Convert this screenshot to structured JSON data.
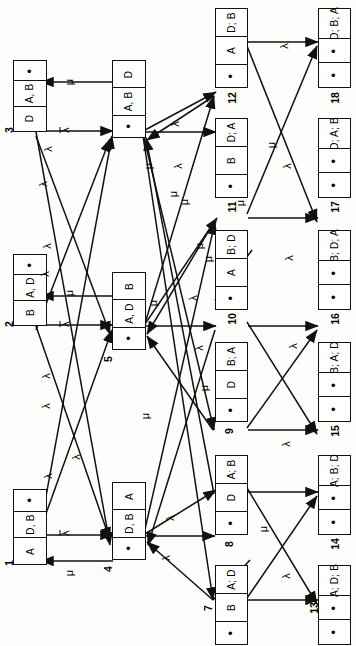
{
  "diagram": {
    "orientation": "rotated-90",
    "symbols": {
      "lambda": "λ",
      "lambda_bar": "λ",
      "mu": "μ",
      "empty": "•"
    },
    "nodes": [
      {
        "id": "1",
        "cells": [
          "A",
          "D, B",
          "•"
        ]
      },
      {
        "id": "2",
        "cells": [
          "B",
          "A, D",
          "•"
        ]
      },
      {
        "id": "3",
        "cells": [
          "D",
          "A, B",
          "•"
        ]
      },
      {
        "id": "4",
        "cells": [
          "•",
          "D, B",
          "A"
        ]
      },
      {
        "id": "5",
        "cells": [
          "•",
          "A, D",
          "B"
        ]
      },
      {
        "id": "6",
        "cells": [
          "•",
          "A, B",
          "D"
        ]
      },
      {
        "id": "7",
        "cells": [
          "•",
          "B",
          "A; D"
        ]
      },
      {
        "id": "8",
        "cells": [
          "•",
          "D",
          "A; B"
        ]
      },
      {
        "id": "9",
        "cells": [
          "•",
          "D",
          "B; A"
        ]
      },
      {
        "id": "10",
        "cells": [
          "•",
          "A",
          "B; D"
        ]
      },
      {
        "id": "11",
        "cells": [
          "•",
          "B",
          "D; A"
        ]
      },
      {
        "id": "12",
        "cells": [
          "•",
          "A",
          "D; B"
        ]
      },
      {
        "id": "13",
        "cells": [
          "•",
          "•",
          "A; D; B"
        ]
      },
      {
        "id": "14",
        "cells": [
          "•",
          "•",
          "A; B; D"
        ]
      },
      {
        "id": "15",
        "cells": [
          "•",
          "•",
          "B; A; D"
        ]
      },
      {
        "id": "16",
        "cells": [
          "•",
          "•",
          "B; D; A"
        ]
      },
      {
        "id": "17",
        "cells": [
          "•",
          "•",
          "D; A; B"
        ]
      },
      {
        "id": "18",
        "cells": [
          "•",
          "•",
          "D; B; A"
        ]
      }
    ],
    "edge_labels": [
      {
        "key": "e1",
        "text": "λ",
        "bar": true,
        "x": 63,
        "y": 527
      },
      {
        "key": "e2",
        "text": "μ",
        "bar": false,
        "x": 66,
        "y": 567
      },
      {
        "key": "e3",
        "text": "λ",
        "bar": true,
        "x": 63,
        "y": 318
      },
      {
        "key": "e4",
        "text": "μ",
        "bar": false,
        "x": 66,
        "y": 287
      },
      {
        "key": "e5",
        "text": "λ",
        "bar": true,
        "x": 63,
        "y": 124
      },
      {
        "key": "e6",
        "text": "μ",
        "bar": false,
        "x": 66,
        "y": 76
      },
      {
        "key": "e7",
        "text": "λ",
        "bar": false,
        "x": 45,
        "y": 143
      },
      {
        "key": "e8",
        "text": "λ",
        "bar": false,
        "x": 40,
        "y": 178
      },
      {
        "key": "e9",
        "text": "λ",
        "bar": false,
        "x": 44,
        "y": 240
      },
      {
        "key": "e10",
        "text": "λ",
        "bar": false,
        "x": 42,
        "y": 268
      },
      {
        "key": "e11",
        "text": "λ",
        "bar": false,
        "x": 43,
        "y": 370
      },
      {
        "key": "e12",
        "text": "λ",
        "bar": false,
        "x": 43,
        "y": 400
      },
      {
        "key": "e13",
        "text": "λ",
        "bar": false,
        "x": 45,
        "y": 470
      },
      {
        "key": "e14",
        "text": "λ",
        "bar": false,
        "x": 73,
        "y": 451
      },
      {
        "key": "e15",
        "text": "λ",
        "bar": false,
        "x": 167,
        "y": 512
      },
      {
        "key": "e16",
        "text": "λ",
        "bar": false,
        "x": 163,
        "y": 552
      },
      {
        "key": "e17",
        "text": "λ",
        "bar": false,
        "x": 172,
        "y": 118
      },
      {
        "key": "e18",
        "text": "λ",
        "bar": false,
        "x": 175,
        "y": 160
      },
      {
        "key": "e19",
        "text": "λ",
        "bar": false,
        "x": 190,
        "y": 292
      },
      {
        "key": "e20",
        "text": "λ",
        "bar": false,
        "x": 196,
        "y": 342
      },
      {
        "key": "e21",
        "text": "μ",
        "bar": false,
        "x": 145,
        "y": 160
      },
      {
        "key": "e22",
        "text": "μ",
        "bar": false,
        "x": 170,
        "y": 188
      },
      {
        "key": "e23",
        "text": "μ",
        "bar": false,
        "x": 181,
        "y": 196
      },
      {
        "key": "e24",
        "text": "μ",
        "bar": false,
        "x": 150,
        "y": 297
      },
      {
        "key": "e25",
        "text": "μ",
        "bar": false,
        "x": 196,
        "y": 240
      },
      {
        "key": "e26",
        "text": "μ",
        "bar": false,
        "x": 205,
        "y": 253
      },
      {
        "key": "e27",
        "text": "μ",
        "bar": false,
        "x": 201,
        "y": 382
      },
      {
        "key": "e28",
        "text": "μ",
        "bar": false,
        "x": 142,
        "y": 410
      },
      {
        "key": "e29",
        "text": "μ",
        "bar": false,
        "x": 260,
        "y": 523
      },
      {
        "key": "e30",
        "text": "μ",
        "bar": false,
        "x": 268,
        "y": 139
      },
      {
        "key": "e31",
        "text": "λ",
        "bar": false,
        "x": 281,
        "y": 40
      },
      {
        "key": "e32",
        "text": "λ",
        "bar": false,
        "x": 284,
        "y": 160
      },
      {
        "key": "e33",
        "text": "λ",
        "bar": false,
        "x": 286,
        "y": 252
      },
      {
        "key": "e34",
        "text": "λ",
        "bar": false,
        "x": 290,
        "y": 340
      },
      {
        "key": "e35",
        "text": "λ",
        "bar": false,
        "x": 283,
        "y": 438
      },
      {
        "key": "e36",
        "text": "λ",
        "bar": false,
        "x": 283,
        "y": 570
      },
      {
        "key": "e37",
        "text": "μ",
        "bar": false,
        "x": 237,
        "y": 197
      }
    ]
  }
}
